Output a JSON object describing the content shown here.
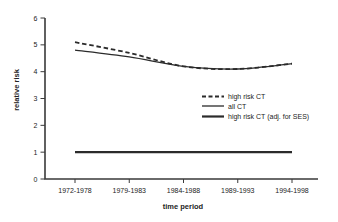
{
  "chart_data": {
    "type": "line",
    "title": "",
    "xlabel": "time period",
    "ylabel": "relative risk",
    "categories": [
      "1972-1978",
      "1979-1983",
      "1984-1988",
      "1989-1993",
      "1994-1998"
    ],
    "ylim": [
      0,
      6
    ],
    "yticks": [
      0,
      1,
      2,
      3,
      4,
      5,
      6
    ],
    "grid": false,
    "legend_position": "inside-right-middle",
    "axis_color": "#3a3a3a",
    "text_color": "#232323",
    "line_color": "#2b2b2b",
    "series": [
      {
        "name": "high risk CT",
        "line_style": "dashed",
        "line_width": 1.8,
        "color": "#2b2b2b",
        "values": [
          5.1,
          4.7,
          4.2,
          4.1,
          4.3
        ]
      },
      {
        "name": "all CT",
        "line_style": "solid",
        "line_width": 1.3,
        "color": "#2b2b2b",
        "values": [
          4.8,
          4.55,
          4.2,
          4.1,
          4.3
        ]
      },
      {
        "name": "high risk CT (adj. for SES)",
        "line_style": "solid",
        "line_width": 2.2,
        "color": "#2b2b2b",
        "values": [
          1,
          1,
          1,
          1,
          1
        ]
      }
    ]
  }
}
